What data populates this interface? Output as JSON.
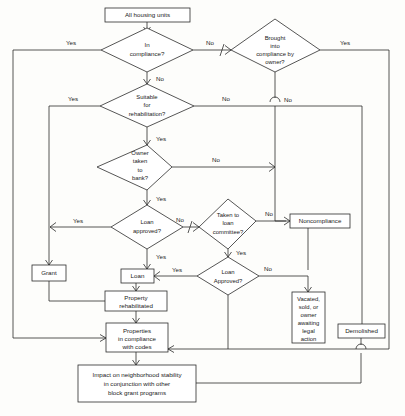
{
  "diagram": {
    "colors": {
      "line": "#2b2b2b",
      "shape_fill": "#ffffff",
      "background": "#fdfdfb",
      "text": "#1a1a1a"
    },
    "nodes": {
      "all_housing_units": {
        "label": "All housing units",
        "shape": "box"
      },
      "in_compliance": {
        "line1": "In",
        "line2": "compliance?",
        "shape": "diamond"
      },
      "brought_into_compliance": {
        "line1": "Brought",
        "line2": "into",
        "line3": "compliance by",
        "line4": "owner?",
        "shape": "diamond"
      },
      "suitable_rehab": {
        "line1": "Suitable",
        "line2": "for",
        "line3": "rehabilitation?",
        "shape": "diamond"
      },
      "owner_bank": {
        "line1": "Owner",
        "line2": "taken",
        "line3": "to",
        "line4": "bank?",
        "shape": "diamond"
      },
      "loan_approved_1": {
        "line1": "Loan",
        "line2": "approved?",
        "shape": "diamond"
      },
      "loan_committee": {
        "line1": "Taken to",
        "line2": "loan",
        "line3": "committee?",
        "shape": "diamond"
      },
      "loan_approved_2": {
        "line1": "Loan",
        "line2": "Approved?",
        "shape": "diamond"
      },
      "noncompliance": {
        "label": "Noncompliance",
        "shape": "box"
      },
      "grant": {
        "label": "Grant",
        "shape": "box"
      },
      "loan": {
        "label": "Loan",
        "shape": "box"
      },
      "property_rehabilitated": {
        "line1": "Property",
        "line2": "rehabilitated",
        "shape": "box"
      },
      "properties_in_compliance": {
        "line1": "Properties",
        "line2": "in compliance",
        "line3": "with codes",
        "shape": "box"
      },
      "vacated_sold_owner": {
        "line1": "Vacated,",
        "line2": "sold, or",
        "line3": "owner",
        "line4": "awaiting",
        "line5": "legal",
        "line6": "action",
        "shape": "box"
      },
      "demolished": {
        "label": "Demolished",
        "shape": "box"
      },
      "impact": {
        "line1": "Impact on neighborhood stability",
        "line2": "in conjunction with other",
        "line3": "block grant programs",
        "shape": "box"
      }
    },
    "edge_labels": {
      "in_compliance_yes": "Yes",
      "in_compliance_no_right": "No",
      "in_compliance_no_down": "No",
      "brought_yes": "Yes",
      "brought_no": "No",
      "suitable_yes": "Yes",
      "suitable_no": "No",
      "suitable_down_yes": "Yes",
      "owner_bank_no": "No",
      "owner_bank_yes": "Yes",
      "loan_approved_1_yes_left": "Yes",
      "loan_approved_1_no": "No",
      "loan_approved_1_yes_down": "Yes",
      "loan_committee_no": "No",
      "loan_committee_yes": "Yes",
      "loan_approved_2_yes": "Yes",
      "loan_approved_2_no": "No"
    }
  }
}
